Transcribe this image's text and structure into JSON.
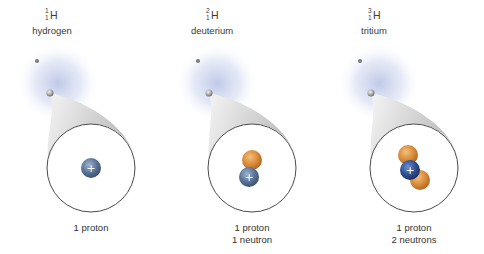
{
  "isotopes": [
    {
      "name": "hydrogen",
      "element": "H",
      "mass_number": "1",
      "atomic_number": "1",
      "protons": 1,
      "neutrons": 0,
      "caption_lines": [
        "1 proton"
      ]
    },
    {
      "name": "deuterium",
      "element": "H",
      "mass_number": "2",
      "atomic_number": "1",
      "protons": 1,
      "neutrons": 1,
      "caption_lines": [
        "1 proton",
        "1 neutron"
      ]
    },
    {
      "name": "tritium",
      "element": "H",
      "mass_number": "3",
      "atomic_number": "1",
      "protons": 1,
      "neutrons": 2,
      "caption_lines": [
        "1 proton",
        "2 neutrons"
      ]
    }
  ],
  "proton_sign": "+",
  "colors": {
    "proton": "#5a7496",
    "proton_tritium": "#2f4f8f",
    "neutron": "#d98b3a",
    "cloud": "#b9c6e6",
    "cone": "#cfcfcf",
    "circle_stroke": "#4a4a4a"
  }
}
